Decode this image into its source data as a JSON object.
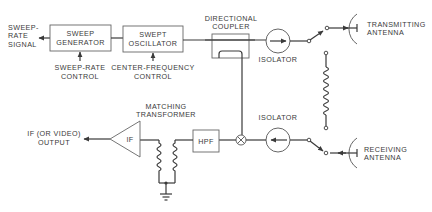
{
  "diagram": {
    "type": "block-diagram",
    "blocks": {
      "sweep_generator": {
        "line1": "SWEEP",
        "line2": "GENERATOR"
      },
      "swept_oscillator": {
        "line1": "SWEPT",
        "line2": "OSCILLATOR"
      },
      "directional_coupler": {
        "line1": "DIRECTIONAL",
        "line2": "COUPLER"
      },
      "isolator_tx": {
        "label": "ISOLATOR"
      },
      "isolator_rx": {
        "label": "ISOLATOR"
      },
      "hpf": {
        "label": "HPF"
      },
      "if_amp": {
        "label": "IF"
      },
      "matching_transformer": {
        "line1": "MATCHING",
        "line2": "TRANSFORMER"
      }
    },
    "labels": {
      "sweep_rate_signal": {
        "line1": "SWEEP-",
        "line2": "RATE",
        "line3": "SIGNAL"
      },
      "sweep_rate_control": {
        "line1": "SWEEP-RATE",
        "line2": "CONTROL"
      },
      "center_frequency_control": {
        "line1": "CENTER-FREQUENCY",
        "line2": "CONTROL"
      },
      "transmitting_antenna": {
        "line1": "TRANSMITTING",
        "line2": "ANTENNA"
      },
      "receiving_antenna": {
        "line1": "RECEIVING",
        "line2": "ANTENNA"
      },
      "if_output": {
        "line1": "IF (OR VIDEO)",
        "line2": "OUTPUT"
      }
    },
    "colors": {
      "line": "#3a3a3a",
      "background": "#ffffff"
    }
  }
}
